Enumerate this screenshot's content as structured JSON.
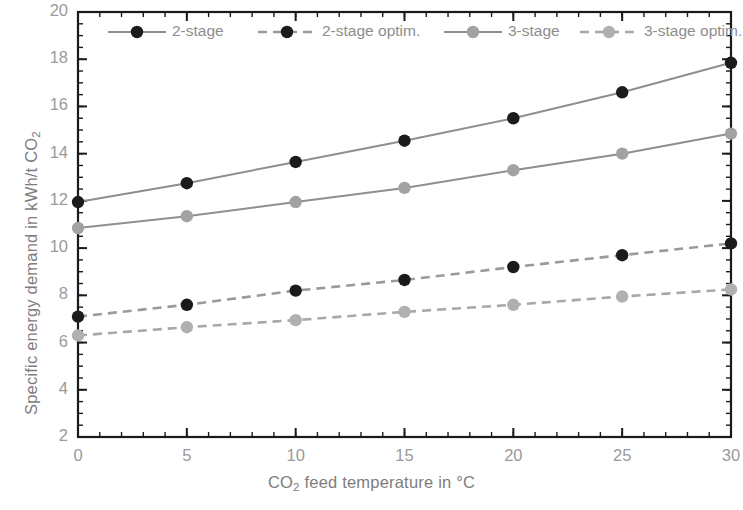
{
  "chart_data": {
    "type": "line",
    "title": "",
    "xlabel": "CO2 feed temperature in °C",
    "ylabel": "Specific energy demand in kWh/t CO2",
    "xlim": [
      0,
      30
    ],
    "ylim": [
      2,
      20
    ],
    "xticks": [
      "0",
      "5",
      "10",
      "15",
      "20",
      "25",
      "30"
    ],
    "yticks": [
      "2",
      "4",
      "6",
      "8",
      "10",
      "12",
      "14",
      "16",
      "18",
      "20"
    ],
    "x_minor_tick_step": 1,
    "y_minor_tick_step": 0.5,
    "grid": false,
    "legend_position": "top-inside",
    "x": [
      0,
      5,
      10,
      15,
      20,
      25,
      30
    ],
    "series": [
      {
        "name": "2-stage",
        "values": [
          11.95,
          12.75,
          13.65,
          14.55,
          15.5,
          16.6,
          17.85
        ],
        "color": "#1b1b1b",
        "line_color": "#8f8f8f",
        "style": "solid",
        "marker": "circle"
      },
      {
        "name": "2-stage optim.",
        "values": [
          7.1,
          7.6,
          8.2,
          8.65,
          9.2,
          9.7,
          10.2
        ],
        "color": "#1b1b1b",
        "line_color": "#9a9a9a",
        "style": "dashed",
        "marker": "circle"
      },
      {
        "name": "3-stage",
        "values": [
          10.85,
          11.35,
          11.95,
          12.55,
          13.3,
          14.0,
          14.85
        ],
        "color": "#a2a2a2",
        "line_color": "#8f8f8f",
        "style": "solid",
        "marker": "circle"
      },
      {
        "name": "3-stage optim.",
        "values": [
          6.3,
          6.65,
          6.95,
          7.3,
          7.6,
          7.95,
          8.25
        ],
        "color": "#b0b0b0",
        "line_color": "#a8a8a8",
        "style": "dashed",
        "marker": "circle"
      }
    ]
  },
  "axes": {
    "y_title_parts": {
      "main": "Specific energy demand in kWh/t CO",
      "sub": "2"
    },
    "x_title_parts": {
      "pre": "CO",
      "sub": "2",
      "post": " feed temperature in °C"
    }
  },
  "legend": {
    "items": [
      {
        "label": "2-stage"
      },
      {
        "label": "2-stage optim."
      },
      {
        "label": "3-stage"
      },
      {
        "label": "3-stage optim."
      }
    ]
  },
  "colors": {
    "frame": "#1a1a1a",
    "tick_text": "#9a9a9a",
    "axis_title": "#7d7d7d",
    "background": "#ffffff"
  }
}
